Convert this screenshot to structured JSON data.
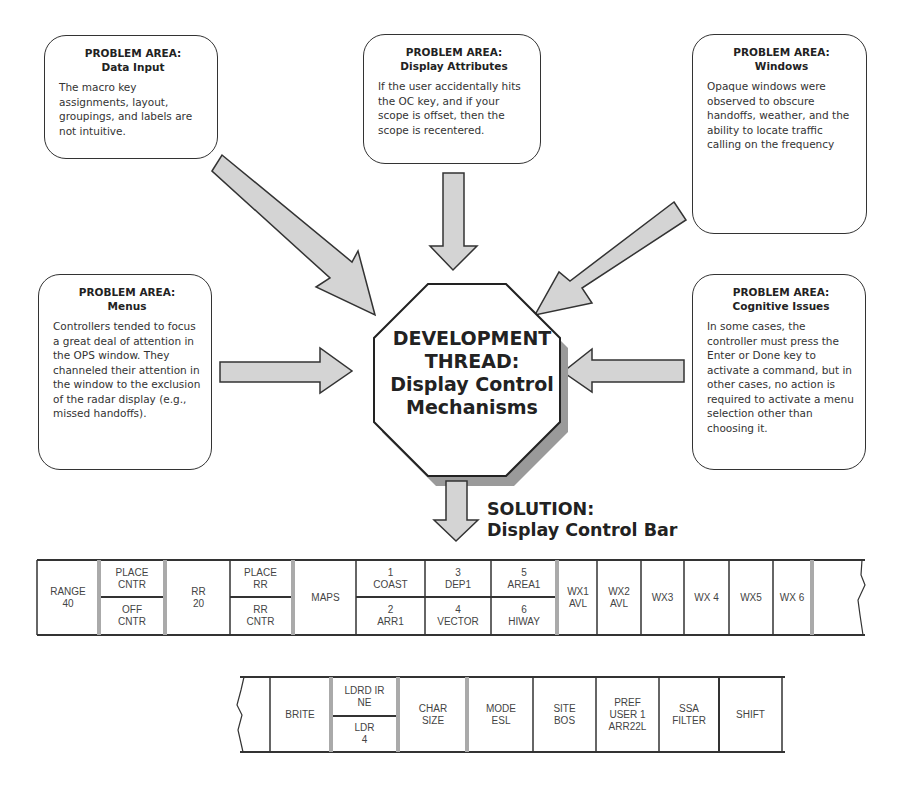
{
  "problem_areas": [
    {
      "id": "data-input",
      "title_line1": "PROBLEM AREA:",
      "title_line2": "Data Input",
      "body": "The macro key assignments, layout, groupings, and labels are not intuitive."
    },
    {
      "id": "display-attributes",
      "title_line1": "PROBLEM AREA:",
      "title_line2": "Display Attributes",
      "body": "If the user accidentally hits the OC key, and if your scope is offset, then the scope is recentered."
    },
    {
      "id": "windows",
      "title_line1": "PROBLEM AREA:",
      "title_line2": "Windows",
      "body": "Opaque windows were observed to obscure handoffs, weather, and the ability to locate traffic calling on the frequency"
    },
    {
      "id": "menus",
      "title_line1": "PROBLEM AREA:",
      "title_line2": "Menus",
      "body": "Controllers tended to focus a great deal of attention in the OPS window.  They channeled their attention in the window to the exclusion of the radar display (e.g., missed handoffs)."
    },
    {
      "id": "cognitive-issues",
      "title_line1": "PROBLEM AREA:",
      "title_line2": "Cognitive Issues",
      "body": "In some cases, the controller must press the Enter or Done key to activate a command, but in other cases, no action is required to activate a menu selection other than choosing it."
    }
  ],
  "center": {
    "line1": "DEVELOPMENT",
    "line2": "THREAD:",
    "line3": "Display Control",
    "line4": "Mechanisms"
  },
  "solution": {
    "line1": "SOLUTION:",
    "line2": "Display Control Bar"
  },
  "colors": {
    "arrow_fill": "#d4d4d4",
    "stroke": "#333333",
    "separator": "#aaaaaa",
    "shadow": "#9a9a9a"
  },
  "control_bar_top": {
    "cells": [
      {
        "l1": "RANGE",
        "l2": "40"
      },
      {
        "l1": "PLACE",
        "l2": "CNTR"
      },
      {
        "l1": "OFF",
        "l2": "CNTR"
      },
      {
        "l1": "RR",
        "l2": "20"
      },
      {
        "l1": "PLACE",
        "l2": "RR"
      },
      {
        "l1": "RR",
        "l2": "CNTR"
      },
      {
        "l1": "MAPS",
        "l2": ""
      },
      {
        "l1": "1",
        "l2": "COAST"
      },
      {
        "l1": "2",
        "l2": "ARR1"
      },
      {
        "l1": "3",
        "l2": "DEP1"
      },
      {
        "l1": "4",
        "l2": "VECTOR"
      },
      {
        "l1": "5",
        "l2": "AREA1"
      },
      {
        "l1": "6",
        "l2": "HIWAY"
      },
      {
        "l1": "WX1",
        "l2": "AVL"
      },
      {
        "l1": "WX2",
        "l2": "AVL"
      },
      {
        "l1": "WX3",
        "l2": ""
      },
      {
        "l1": "WX 4",
        "l2": ""
      },
      {
        "l1": "WX5",
        "l2": ""
      },
      {
        "l1": "WX 6",
        "l2": ""
      }
    ]
  },
  "control_bar_bottom": {
    "cells": [
      {
        "l1": "BRITE",
        "l2": "",
        "l3": ""
      },
      {
        "l1": "LDRD IR",
        "l2": "NE",
        "l3": ""
      },
      {
        "l1": "LDR",
        "l2": "4",
        "l3": ""
      },
      {
        "l1": "CHAR",
        "l2": "SIZE",
        "l3": ""
      },
      {
        "l1": "MODE",
        "l2": "ESL",
        "l3": ""
      },
      {
        "l1": "SITE",
        "l2": "BOS",
        "l3": ""
      },
      {
        "l1": "PREF",
        "l2": "USER 1",
        "l3": "ARR22L"
      },
      {
        "l1": "SSA",
        "l2": "FILTER",
        "l3": ""
      },
      {
        "l1": "SHIFT",
        "l2": "",
        "l3": ""
      }
    ]
  }
}
